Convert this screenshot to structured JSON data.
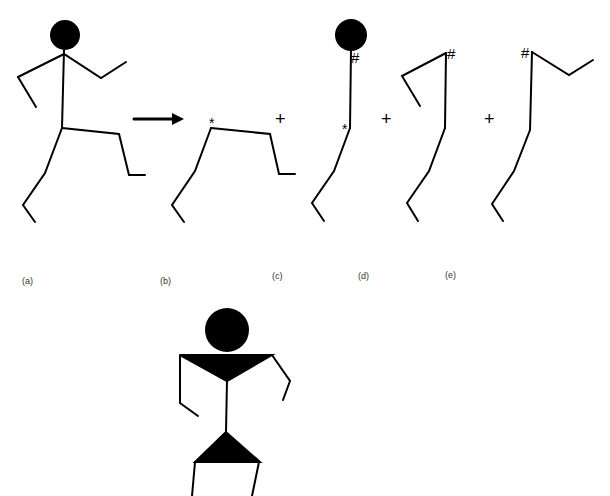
{
  "figure": {
    "panels": [
      {
        "id": "a",
        "label": "(a)",
        "description": "full running stick figure"
      },
      {
        "id": "b",
        "label": "(b)",
        "description": "legs component"
      },
      {
        "id": "c",
        "label": "(c)",
        "description": "head and torso with left leg"
      },
      {
        "id": "d",
        "label": "(d)",
        "description": "left arm with leg"
      },
      {
        "id": "e",
        "label": "(e)",
        "description": "right arm with leg"
      }
    ],
    "operators": {
      "arrow": "→",
      "plus": "+"
    },
    "markers": {
      "star": "*",
      "hash": "#"
    },
    "bottom_figure": {
      "description": "stick figure with triangular torso and hips"
    },
    "colors": {
      "ink": "#000000",
      "background": "#ffffff"
    }
  }
}
